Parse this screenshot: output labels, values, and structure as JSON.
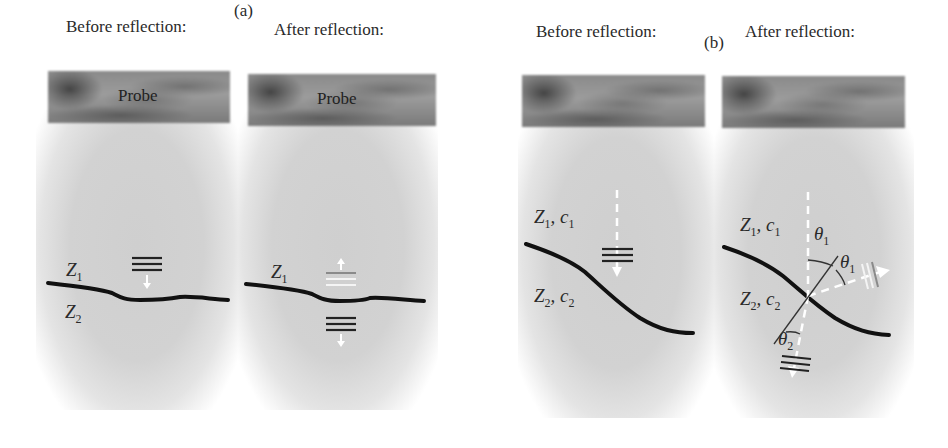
{
  "panels": [
    {
      "label": "(a)",
      "columns": [
        {
          "title": "Before reflection:",
          "probe_label": "Probe",
          "media_labels": {
            "upper": "Z",
            "upper_sub": "1",
            "lower": "Z",
            "lower_sub": "2"
          }
        },
        {
          "title": "After reflection:",
          "probe_label": "Probe",
          "media_labels": {
            "upper": "Z",
            "upper_sub": "1"
          }
        }
      ]
    },
    {
      "label": "(b)",
      "columns": [
        {
          "title": "Before reflection:",
          "media_labels": {
            "upper": "Z",
            "upper_sub": "1",
            "upper_c": "c",
            "upper_c_sub": "1",
            "lower": "Z",
            "lower_sub": "2",
            "lower_c": "c",
            "lower_c_sub": "2"
          }
        },
        {
          "title": "After reflection:",
          "media_labels": {
            "upper": "Z",
            "upper_sub": "1",
            "upper_c": "c",
            "upper_c_sub": "1",
            "lower": "Z",
            "lower_sub": "2",
            "lower_c": "c",
            "lower_c_sub": "2"
          },
          "angles": {
            "incident": "θ",
            "incident_sub": "1",
            "reflected": "θ",
            "reflected_sub": "1",
            "transmitted": "θ",
            "transmitted_sub": "2"
          }
        }
      ]
    }
  ],
  "colors": {
    "tissue": "#d2d2d2",
    "probe": "#8a8a8a",
    "interface": "#111111",
    "arrow": "#ffffff"
  }
}
